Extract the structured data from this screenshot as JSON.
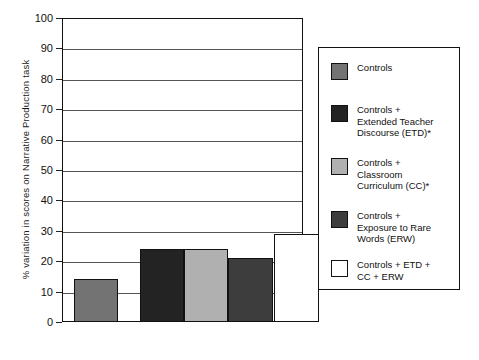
{
  "chart_data": {
    "type": "bar",
    "title": "",
    "xlabel": "",
    "ylabel": "% variation in scores on Narrative Production task",
    "ylim": [
      0,
      100
    ],
    "yticks": [
      0,
      10,
      20,
      30,
      40,
      50,
      60,
      70,
      80,
      90,
      100
    ],
    "ytick_labels": [
      "0",
      "10",
      "20",
      "30",
      "40",
      "50",
      "60",
      "70",
      "80",
      "90",
      "100"
    ],
    "grid": true,
    "legend_position": "right",
    "categories": [
      "Controls",
      "Controls + Extended Teacher Discourse (ETD)*",
      "Controls + Classroom Curriculum (CC)*",
      "Controls + Exposure to Rare Words (ERW)",
      "Controls + ETD + CC + ERW"
    ],
    "values": [
      14,
      24,
      24,
      21,
      29
    ],
    "colors": [
      "#737373",
      "#232323",
      "#b0b0b0",
      "#3d3d3d",
      "#ffffff"
    ]
  },
  "axis": {
    "y_title": "% variation in scores on Narrative Production task",
    "ticks": [
      {
        "label": "100",
        "value": 100
      },
      {
        "label": "90",
        "value": 90
      },
      {
        "label": "80",
        "value": 80
      },
      {
        "label": "70",
        "value": 70
      },
      {
        "label": "60",
        "value": 60
      },
      {
        "label": "50",
        "value": 50
      },
      {
        "label": "40",
        "value": 40
      },
      {
        "label": "30",
        "value": 30
      },
      {
        "label": "20",
        "value": 20
      },
      {
        "label": "10",
        "value": 10
      },
      {
        "label": "0",
        "value": 0
      }
    ]
  },
  "legend": {
    "items": [
      {
        "label": "Controls",
        "color": "#737373"
      },
      {
        "label": "Controls +\nExtended Teacher\nDiscourse (ETD)*",
        "color": "#232323"
      },
      {
        "label": "Controls +\nClassroom\nCurriculum (CC)*",
        "color": "#b0b0b0"
      },
      {
        "label": "Controls +\nExposure to Rare\nWords (ERW)",
        "color": "#3d3d3d"
      },
      {
        "label": "Controls + ETD +\nCC + ERW",
        "color": "#ffffff"
      }
    ]
  }
}
